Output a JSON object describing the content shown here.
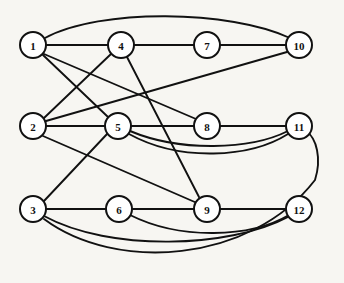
{
  "figure": {
    "type": "undirected-graph",
    "background_color": "#f7f6f2",
    "node_fill": "#ffffff",
    "node_stroke": "#111111",
    "edge_color": "#111111"
  },
  "nodes": [
    {
      "id": "1",
      "label": "1",
      "x": 33,
      "y": 45
    },
    {
      "id": "2",
      "label": "2",
      "x": 33,
      "y": 126
    },
    {
      "id": "3",
      "label": "3",
      "x": 33,
      "y": 209
    },
    {
      "id": "4",
      "label": "4",
      "x": 121,
      "y": 45
    },
    {
      "id": "5",
      "label": "5",
      "x": 118,
      "y": 126
    },
    {
      "id": "6",
      "label": "6",
      "x": 119,
      "y": 209
    },
    {
      "id": "7",
      "label": "7",
      "x": 207,
      "y": 45
    },
    {
      "id": "8",
      "label": "8",
      "x": 207,
      "y": 126
    },
    {
      "id": "9",
      "label": "9",
      "x": 207,
      "y": 209
    },
    {
      "id": "10",
      "label": "10",
      "x": 299,
      "y": 45
    },
    {
      "id": "11",
      "label": "11",
      "x": 299,
      "y": 126
    },
    {
      "id": "12",
      "label": "12",
      "x": 299,
      "y": 209
    }
  ],
  "node_radius": 13,
  "edges": [
    {
      "from": "1",
      "to": "10",
      "shape": "curve",
      "name": "edge-1-10",
      "path": "M 45 38 C 100 8 230 10 290 38"
    },
    {
      "from": "1",
      "to": "4",
      "shape": "line",
      "name": "edge-1-4",
      "path": "M 46 45 L 108 45"
    },
    {
      "from": "1",
      "to": "5",
      "shape": "line",
      "name": "edge-1-5",
      "path": "M 43 55 L 108 117"
    },
    {
      "from": "1",
      "to": "8",
      "shape": "line",
      "name": "edge-1-8",
      "path": "M 44 54 L 196 119"
    },
    {
      "from": "4",
      "to": "7",
      "shape": "line",
      "name": "edge-4-7",
      "path": "M 134 45 L 194 45"
    },
    {
      "from": "4",
      "to": "2",
      "shape": "line",
      "name": "edge-4-2",
      "path": "M 111 54 L 44 118"
    },
    {
      "from": "4",
      "to": "9",
      "shape": "line",
      "name": "edge-4-9",
      "path": "M 127 57 L 199 197"
    },
    {
      "from": "7",
      "to": "10",
      "shape": "line",
      "name": "edge-7-10",
      "path": "M 220 45 L 286 45"
    },
    {
      "from": "2",
      "to": "10",
      "shape": "line",
      "name": "edge-2-10",
      "path": "M 46 121 L 287 52"
    },
    {
      "from": "2",
      "to": "5",
      "shape": "line",
      "name": "edge-2-5",
      "path": "M 46 126 L 105 126"
    },
    {
      "from": "2",
      "to": "3",
      "shape": "line",
      "name": "edge-2-9",
      "path": "M 43 136 L 197 203"
    },
    {
      "from": "5",
      "to": "8",
      "shape": "line",
      "name": "edge-5-8",
      "path": "M 131 126 L 194 126"
    },
    {
      "from": "5",
      "to": "11",
      "shape": "curve",
      "name": "edge-5-11",
      "path": "M 130 131 C 180 152 250 150 288 131"
    },
    {
      "from": "5",
      "to": "11b",
      "shape": "curve",
      "name": "edge-5-11-second",
      "path": "M 129 134 C 180 162 250 158 288 134"
    },
    {
      "from": "5",
      "to": "3",
      "shape": "line",
      "name": "edge-5-3",
      "path": "M 108 133 L 44 201"
    },
    {
      "from": "8",
      "to": "11",
      "shape": "line",
      "name": "edge-8-11",
      "path": "M 220 126 L 286 126"
    },
    {
      "from": "3",
      "to": "6",
      "shape": "line",
      "name": "edge-3-6",
      "path": "M 46 209 L 106 209"
    },
    {
      "from": "3",
      "to": "12",
      "shape": "curve",
      "name": "edge-3-12",
      "path": "M 44 216 C 110 252 230 248 288 217"
    },
    {
      "from": "3",
      "to": "11",
      "shape": "curve",
      "name": "edge-3-11",
      "path": "M 44 219 C 115 272 250 264 315 180 C 322 158 316 138 307 132"
    },
    {
      "from": "6",
      "to": "9",
      "shape": "line",
      "name": "edge-6-9",
      "path": "M 132 209 L 194 209"
    },
    {
      "from": "6",
      "to": "12",
      "shape": "curve",
      "name": "edge-6-12",
      "path": "M 130 215 C 180 240 250 238 289 215"
    },
    {
      "from": "9",
      "to": "12",
      "shape": "line",
      "name": "edge-9-12",
      "path": "M 220 209 L 286 209"
    }
  ],
  "edge_count": 22,
  "node_count": 12
}
